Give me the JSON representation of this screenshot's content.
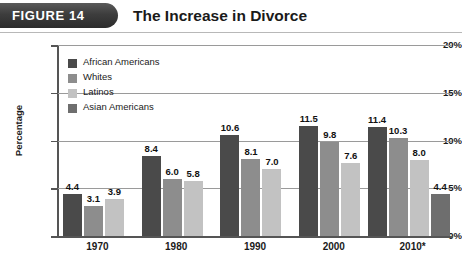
{
  "header": {
    "tab_label": "FIGURE 14",
    "title": "The Increase in Divorce"
  },
  "chart_data": {
    "type": "bar",
    "title": "The Increase in Divorce",
    "xlabel": "",
    "ylabel": "Percentage",
    "ylim": [
      0,
      20
    ],
    "ytick_labels": [
      "0%",
      "5%",
      "10%",
      "15%",
      "20%"
    ],
    "yticks": [
      0,
      5,
      10,
      15,
      20
    ],
    "grid": true,
    "legend_position": "upper-left",
    "categories": [
      "1970",
      "1980",
      "1990",
      "2000",
      "2010*"
    ],
    "series": [
      {
        "name": "African Americans",
        "color": "#4a4a4a",
        "values": [
          4.4,
          8.4,
          10.6,
          11.5,
          11.4
        ],
        "labels": [
          "4.4",
          "8.4",
          "10.6",
          "11.5",
          "11.4"
        ]
      },
      {
        "name": "Whites",
        "color": "#8d8d8d",
        "values": [
          3.1,
          6.0,
          8.1,
          9.8,
          10.3
        ],
        "labels": [
          "3.1",
          "6.0",
          "8.1",
          "9.8",
          "10.3"
        ]
      },
      {
        "name": "Latinos",
        "color": "#c2c2c2",
        "values": [
          3.9,
          5.8,
          7.0,
          7.6,
          8.0
        ],
        "labels": [
          "3.9",
          "5.8",
          "7.0",
          "7.6",
          "8.0"
        ]
      },
      {
        "name": "Asian Americans",
        "color": "#6e6e6e",
        "values": [
          null,
          null,
          null,
          null,
          4.4
        ],
        "labels": [
          "",
          "",
          "",
          "",
          "4.4"
        ]
      }
    ]
  }
}
